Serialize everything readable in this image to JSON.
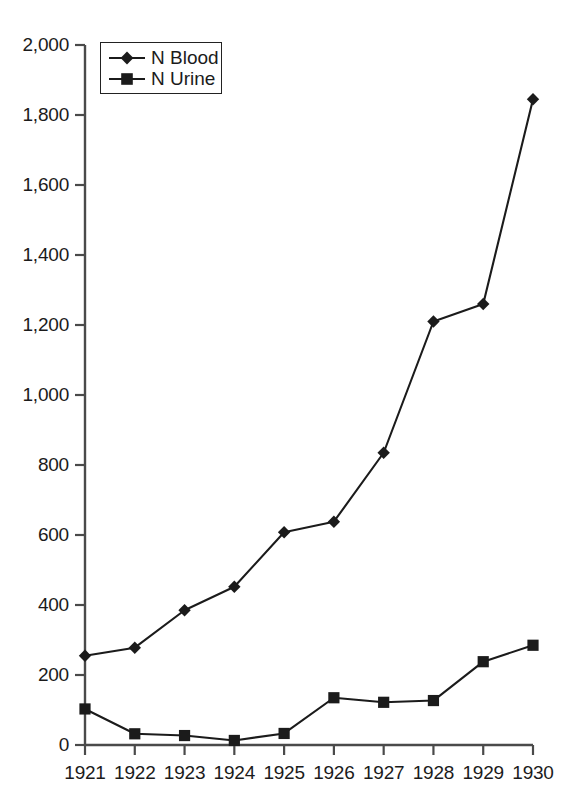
{
  "chart_data": {
    "type": "line",
    "title": "",
    "subtitle": "",
    "xlabel": "",
    "ylabel": "",
    "categories": [
      "1921",
      "1922",
      "1923",
      "1924",
      "1925",
      "1926",
      "1927",
      "1928",
      "1929",
      "1930"
    ],
    "x": [
      1921,
      1922,
      1923,
      1924,
      1925,
      1926,
      1927,
      1928,
      1929,
      1930
    ],
    "series": [
      {
        "name": "N Blood",
        "marker": "diamond",
        "color": "#1b1b1b",
        "values": [
          255,
          278,
          385,
          452,
          608,
          638,
          835,
          1210,
          1260,
          1845
        ]
      },
      {
        "name": "N Urine",
        "marker": "square",
        "color": "#1b1b1b",
        "values": [
          103,
          32,
          27,
          13,
          33,
          135,
          122,
          127,
          238,
          285
        ]
      }
    ],
    "ylim": [
      0,
      2000
    ],
    "yticks": [
      0,
      200,
      400,
      600,
      800,
      1000,
      1200,
      1400,
      1600,
      1800,
      2000
    ],
    "ytick_labels": [
      "0",
      "200",
      "400",
      "600",
      "800",
      "1,000",
      "1,200",
      "1,400",
      "1,600",
      "1,800",
      "2,000"
    ],
    "xtick_labels": [
      "1921",
      "1922",
      "1923",
      "1924",
      "1925",
      "1926",
      "1927",
      "1928",
      "1929",
      "1930"
    ],
    "grid": false,
    "legend_position": "top-left",
    "legend_entries": [
      "N Blood",
      "N Urine"
    ]
  },
  "legend": {
    "items": [
      {
        "label": "N Blood",
        "marker": "diamond"
      },
      {
        "label": "N Urine",
        "marker": "square"
      }
    ]
  },
  "axes": {
    "y_tick_labels": [
      "2,000",
      "1,800",
      "1,600",
      "1,400",
      "1,200",
      "1,000",
      "800",
      "600",
      "400",
      "200",
      "0"
    ],
    "x_tick_labels": [
      "1921",
      "1922",
      "1923",
      "1924",
      "1925",
      "1926",
      "1927",
      "1928",
      "1929",
      "1930"
    ]
  },
  "style": {
    "line_color": "#1b1b1b",
    "axis_color": "#3a3a3a",
    "background": "#ffffff"
  }
}
